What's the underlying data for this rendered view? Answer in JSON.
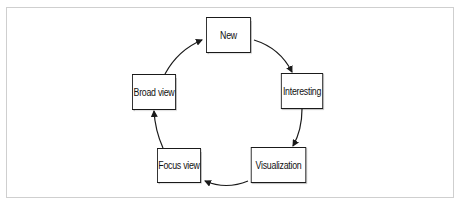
{
  "diagram": {
    "type": "cycle",
    "nodes": [
      {
        "id": "new",
        "label": "New"
      },
      {
        "id": "interesting",
        "label": "Interesting"
      },
      {
        "id": "visualization",
        "label": "Visualization"
      },
      {
        "id": "focus_view",
        "label": "Focus view"
      },
      {
        "id": "broad_view",
        "label": "Broad view"
      }
    ],
    "edges": [
      {
        "from": "New",
        "to": "Interesting"
      },
      {
        "from": "Interesting",
        "to": "Visualization"
      },
      {
        "from": "Visualization",
        "to": "Focus view"
      },
      {
        "from": "Focus view",
        "to": "Broad view"
      },
      {
        "from": "Broad view",
        "to": "New"
      }
    ],
    "colors": {
      "stroke": "#1a1a1a",
      "node_fill": "#ffffff",
      "frame": "#cfcfcf"
    }
  }
}
